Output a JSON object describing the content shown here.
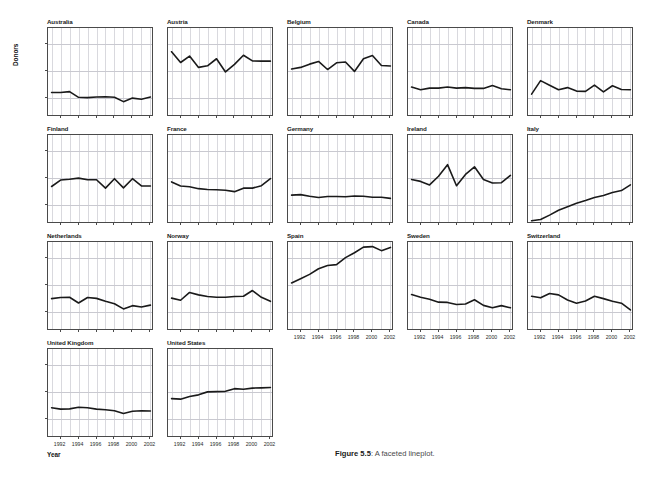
{
  "figure": {
    "caption_label": "Figure 5.5",
    "caption_sep": ": ",
    "caption_text": "A faceted lineplot."
  },
  "axes": {
    "ylabel": "Donors",
    "xlabel": "Year",
    "ytick_labels": [
      "10",
      "20",
      "30"
    ],
    "xtick_labels": [
      "1992",
      "1994",
      "1996",
      "1998",
      "2000",
      "2002"
    ]
  },
  "chart_data": {
    "type": "line",
    "title": "",
    "xlabel": "Year",
    "ylabel": "Donors",
    "xlim": [
      1990.6,
      2002.4
    ],
    "ylim": [
      3,
      36
    ],
    "yticks": [
      10,
      20,
      30
    ],
    "xticks": [
      1992,
      1994,
      1996,
      1998,
      2000,
      2002
    ],
    "grid": true,
    "legend": "none",
    "facet_layout": {
      "rows": 4,
      "cols": 5,
      "shared_x": true,
      "shared_y": true
    },
    "line_color": "#1a1a1a",
    "x": [
      1991,
      1992,
      1993,
      1994,
      1995,
      1996,
      1997,
      1998,
      1999,
      2000,
      2001,
      2002
    ],
    "series": [
      {
        "name": "Australia",
        "values": [
          12.1,
          12.1,
          12.4,
          10.3,
          10.2,
          10.4,
          10.5,
          10.3,
          8.7,
          10.0,
          9.6,
          10.4
        ]
      },
      {
        "name": "Austria",
        "values": [
          27.2,
          23.2,
          25.6,
          21.4,
          22.0,
          24.6,
          19.7,
          22.5,
          25.9,
          23.8,
          23.7,
          23.7
        ]
      },
      {
        "name": "Belgium",
        "values": [
          20.8,
          21.4,
          22.6,
          23.6,
          20.6,
          23.1,
          23.4,
          19.9,
          24.6,
          25.8,
          22.1,
          21.9
        ]
      },
      {
        "name": "Canada",
        "values": [
          14.1,
          13.1,
          13.7,
          13.7,
          14.1,
          13.7,
          13.9,
          13.6,
          13.6,
          14.7,
          13.5,
          13.1
        ]
      },
      {
        "name": "Denmark",
        "values": [
          11.5,
          16.5,
          14.8,
          13.1,
          13.9,
          12.6,
          12.5,
          14.8,
          12.3,
          14.6,
          13.2,
          13.1
        ]
      },
      {
        "name": "Finland",
        "values": [
          16.9,
          19.3,
          19.6,
          20.0,
          19.4,
          19.4,
          16.3,
          19.8,
          16.4,
          19.8,
          17.1,
          17.1
        ]
      },
      {
        "name": "France",
        "values": [
          18.6,
          17.1,
          16.8,
          16.1,
          15.8,
          15.7,
          15.5,
          15.0,
          16.3,
          16.3,
          17.2,
          19.8
        ]
      },
      {
        "name": "Germany",
        "values": [
          13.7,
          13.9,
          13.3,
          12.8,
          13.2,
          13.2,
          13.1,
          13.4,
          13.3,
          12.9,
          12.9,
          12.5
        ]
      },
      {
        "name": "Ireland",
        "values": [
          19.5,
          18.8,
          17.5,
          20.7,
          25.0,
          17.2,
          21.4,
          24.2,
          19.5,
          18.2,
          18.3,
          21.0
        ]
      },
      {
        "name": "Italy",
        "values": [
          4.2,
          4.7,
          6.3,
          8.1,
          9.4,
          10.7,
          11.7,
          12.8,
          13.6,
          14.7,
          15.4,
          17.5
        ]
      },
      {
        "name": "Netherlands",
        "values": [
          15.0,
          15.4,
          15.5,
          13.4,
          15.4,
          15.1,
          14.0,
          13.1,
          11.2,
          12.4,
          11.9,
          12.6
        ]
      },
      {
        "name": "Norway",
        "values": [
          15.2,
          14.4,
          17.3,
          16.4,
          15.8,
          15.5,
          15.5,
          15.8,
          15.9,
          18.0,
          15.5,
          14.0
        ]
      },
      {
        "name": "Spain",
        "values": [
          20.8,
          22.4,
          24.0,
          26.1,
          27.3,
          27.6,
          30.2,
          32.0,
          34.1,
          34.3,
          32.8,
          34.0
        ]
      },
      {
        "name": "Sweden",
        "values": [
          16.5,
          15.5,
          14.8,
          13.7,
          13.6,
          12.8,
          13.0,
          14.6,
          12.5,
          11.6,
          12.4,
          11.6
        ]
      },
      {
        "name": "Switzerland",
        "values": [
          15.9,
          15.3,
          16.9,
          16.4,
          14.5,
          13.3,
          14.1,
          15.9,
          15.0,
          14.0,
          13.3,
          10.8
        ]
      },
      {
        "name": "United Kingdom",
        "values": [
          14.2,
          13.7,
          13.8,
          14.4,
          14.2,
          13.7,
          13.5,
          13.1,
          12.1,
          12.9,
          13.1,
          13.0
        ]
      },
      {
        "name": "United States",
        "values": [
          17.6,
          17.4,
          18.4,
          19.0,
          20.1,
          20.2,
          20.3,
          21.3,
          21.1,
          21.5,
          21.6,
          21.7
        ]
      }
    ]
  }
}
